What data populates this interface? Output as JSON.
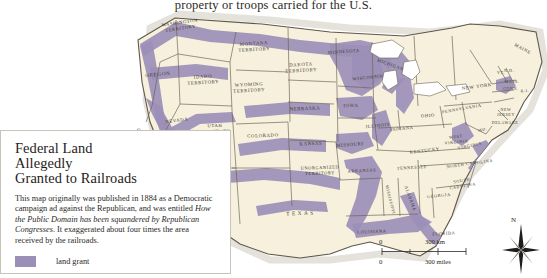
{
  "page_running_text": "property or troops carried for the U.S.",
  "caption": {
    "title_lines": [
      "Federal Land",
      "Allegedly",
      "Granted to Railroads"
    ],
    "body_part1": "This map originally was published in 1884 as a Democratic campaign ad against the Republican, and was entitled ",
    "body_italic": "How the Public Domain has been squandered by Republican Congresses",
    "body_part2": ". It exaggerated about four times the area received by the railroads.",
    "legend_label": "land grant",
    "legend_color": "#9b8fb7"
  },
  "colors": {
    "land_grant": "#9b8fb7",
    "land_fill": "#f6f0dc",
    "water": "#ffffff",
    "border": "#6b6355",
    "coast_shadow": "#cfcabd",
    "caption_border": "#c9c4bb",
    "text": "#2b2824"
  },
  "scale": {
    "km_zero": "0",
    "km_label": "300 km",
    "mi_zero": "0",
    "mi_label": "300 miles"
  },
  "compass": {
    "north_label": "N"
  },
  "map": {
    "title": "Federal Land Allegedly Granted to Railroads",
    "states": [
      {
        "name": "WASHINGTON TERRITORY",
        "lines": [
          "WASHINGTON",
          "TERRITORY"
        ],
        "x": 180,
        "y": 14,
        "size": 4.6,
        "rot": -8
      },
      {
        "name": "OREGON",
        "lines": [
          "OREGON"
        ],
        "x": 158,
        "y": 66,
        "size": 5.2,
        "rot": -6
      },
      {
        "name": "IDAHO TERRITORY",
        "lines": [
          "IDAHO",
          "TERRITORY"
        ],
        "x": 203,
        "y": 68,
        "size": 4.8,
        "rot": -4
      },
      {
        "name": "MONTANA TERRITORY",
        "lines": [
          "MONTANA",
          "TERRITORY"
        ],
        "x": 254,
        "y": 35,
        "size": 4.8,
        "rot": -4
      },
      {
        "name": "WYOMING TERRITORY",
        "lines": [
          "WYOMING",
          "TERRITORY"
        ],
        "x": 249,
        "y": 76,
        "size": 4.8,
        "rot": -3
      },
      {
        "name": "DAKOTA TERRITORY",
        "lines": [
          "DAKOTA",
          "TERRITORY"
        ],
        "x": 301,
        "y": 56,
        "size": 4.8,
        "rot": -3
      },
      {
        "name": "MINNESOTA",
        "lines": [
          "MINNESOTA"
        ],
        "x": 344,
        "y": 43,
        "size": 4.6,
        "rot": -4
      },
      {
        "name": "NEVADA",
        "lines": [
          "NEVADA"
        ],
        "x": 177,
        "y": 112,
        "size": 4.8,
        "rot": -8
      },
      {
        "name": "CALIFORNIA",
        "lines": [
          "CALIFORNIA"
        ],
        "x": 150,
        "y": 131,
        "size": 4.8,
        "rot": 38
      },
      {
        "name": "UTAH TERRITORY",
        "lines": [
          "UTAH",
          "TERRITORY"
        ],
        "x": 215,
        "y": 117,
        "size": 4.6,
        "rot": -2
      },
      {
        "name": "COLORADO",
        "lines": [
          "COLORADO"
        ],
        "x": 263,
        "y": 127,
        "size": 4.8,
        "rot": -2
      },
      {
        "name": "NEBRASKA",
        "lines": [
          "NEBRASKA"
        ],
        "x": 305,
        "y": 100,
        "size": 4.8,
        "rot": -2
      },
      {
        "name": "IOWA",
        "lines": [
          "IOWA"
        ],
        "x": 351,
        "y": 97,
        "size": 4.8,
        "rot": -2
      },
      {
        "name": "WISCONSIN",
        "lines": [
          "WISCONSIN"
        ],
        "x": 368,
        "y": 69,
        "size": 4.6,
        "rot": -6
      },
      {
        "name": "KANSAS",
        "lines": [
          "KANSAS"
        ],
        "x": 311,
        "y": 135,
        "size": 4.8,
        "rot": -2
      },
      {
        "name": "MISSOURI",
        "lines": [
          "MISSOURI"
        ],
        "x": 350,
        "y": 136,
        "size": 4.8,
        "rot": -4
      },
      {
        "name": "ILLINOIS",
        "lines": [
          "ILLINOIS"
        ],
        "x": 378,
        "y": 117,
        "size": 4.6,
        "rot": -6
      },
      {
        "name": "INDIANA",
        "lines": [
          "INDIANA"
        ],
        "x": 402,
        "y": 120,
        "size": 4.4,
        "rot": -6
      },
      {
        "name": "MICHIGAN",
        "lines": [
          "MICHIGAN"
        ],
        "x": 390,
        "y": 56,
        "size": 4.6,
        "rot": 20
      },
      {
        "name": "OHIO",
        "lines": [
          "OHIO"
        ],
        "x": 428,
        "y": 107,
        "size": 4.6,
        "rot": -4
      },
      {
        "name": "UNORGANIZED TERRITORY",
        "lines": [
          "UNORGANIZED",
          "TERRITORY"
        ],
        "x": 320,
        "y": 159,
        "size": 4.4,
        "rot": -2
      },
      {
        "name": "TEXAS",
        "lines": [
          "T E X A S"
        ],
        "x": 300,
        "y": 205,
        "size": 5.4,
        "rot": -2
      },
      {
        "name": "ARKANSAS",
        "lines": [
          "ARKANSAS"
        ],
        "x": 362,
        "y": 162,
        "size": 4.4,
        "rot": -3
      },
      {
        "name": "LOUISIANA",
        "lines": [
          "LOUISIANA"
        ],
        "x": 372,
        "y": 223,
        "size": 4.4,
        "rot": -3
      },
      {
        "name": "MISSISSIPPI",
        "lines": [
          "MISSISSIPPI"
        ],
        "x": 389,
        "y": 190,
        "size": 4.2,
        "rot": 76
      },
      {
        "name": "ALABAMA",
        "lines": [
          "ALABAMA"
        ],
        "x": 409,
        "y": 189,
        "size": 4.4,
        "rot": 70
      },
      {
        "name": "TENNESSEE",
        "lines": [
          "TENNESSEE"
        ],
        "x": 412,
        "y": 159,
        "size": 4.4,
        "rot": -4
      },
      {
        "name": "KENTUCKY",
        "lines": [
          "KENTUCKY"
        ],
        "x": 425,
        "y": 142,
        "size": 4.6,
        "rot": -7
      },
      {
        "name": "WEST VIRGINIA",
        "lines": [
          "WEST",
          "VIRGINIA"
        ],
        "x": 456,
        "y": 128,
        "size": 4.2,
        "rot": -6
      },
      {
        "name": "VIRGINIA",
        "lines": [
          "VIRGINIA"
        ],
        "x": 470,
        "y": 137,
        "size": 4.4,
        "rot": -12
      },
      {
        "name": "NORTH CAROLINA",
        "lines": [
          "NORTH CAROLINA"
        ],
        "x": 470,
        "y": 155,
        "size": 4.4,
        "rot": -8
      },
      {
        "name": "SOUTH CAROLINA",
        "lines": [
          "SOUTH",
          "CAROLINA"
        ],
        "x": 462,
        "y": 172,
        "size": 4.2,
        "rot": -10
      },
      {
        "name": "GEORGIA",
        "lines": [
          "GEORGIA"
        ],
        "x": 439,
        "y": 187,
        "size": 4.4,
        "rot": -6
      },
      {
        "name": "FLORIDA",
        "lines": [
          "FLORIDA"
        ],
        "x": 444,
        "y": 225,
        "size": 4.4,
        "rot": -4
      },
      {
        "name": "PENNSYLVANIA",
        "lines": [
          "PENNSYLVANIA"
        ],
        "x": 462,
        "y": 100,
        "size": 4.4,
        "rot": -10
      },
      {
        "name": "NEW YORK",
        "lines": [
          "NEW YORK"
        ],
        "x": 477,
        "y": 78,
        "size": 4.8,
        "rot": -8
      },
      {
        "name": "MAINE",
        "lines": [
          "MAINE"
        ],
        "x": 522,
        "y": 40,
        "size": 4.6,
        "rot": 28
      },
      {
        "name": "NEW HAMPSHIRE",
        "lines": [
          "N.H."
        ],
        "x": 509,
        "y": 62,
        "size": 4.0,
        "rot": 0
      },
      {
        "name": "VERMONT",
        "lines": [
          "VT."
        ],
        "x": 501,
        "y": 64,
        "size": 4.0,
        "rot": 0
      },
      {
        "name": "MASSACHUSETTS",
        "lines": [
          "MASS."
        ],
        "x": 512,
        "y": 73,
        "size": 4.0,
        "rot": 0
      },
      {
        "name": "CONNECTICUT",
        "lines": [
          "CONN."
        ],
        "x": 511,
        "y": 80,
        "size": 4.0,
        "rot": 0
      },
      {
        "name": "RHODE ISLAND",
        "lines": [
          "R.I."
        ],
        "x": 525,
        "y": 82,
        "size": 4.0,
        "rot": -6
      },
      {
        "name": "NEW JERSEY",
        "lines": [
          "NEW",
          "JERSEY"
        ],
        "x": 506,
        "y": 101,
        "size": 4.0,
        "rot": 0
      },
      {
        "name": "DELAWARE",
        "lines": [
          "DELAWARE"
        ],
        "x": 505,
        "y": 114,
        "size": 4.0,
        "rot": 0
      },
      {
        "name": "MARYLAND",
        "lines": [
          "MD."
        ],
        "x": 483,
        "y": 121,
        "size": 4.0,
        "rot": -14
      }
    ]
  }
}
